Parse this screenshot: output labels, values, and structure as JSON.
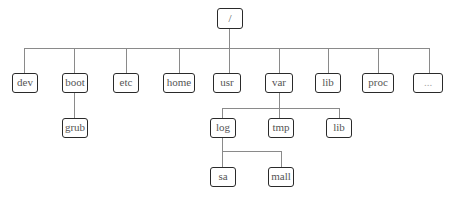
{
  "diagram": {
    "type": "directory-tree",
    "root": {
      "label": "/"
    },
    "level1": [
      {
        "label": "dev"
      },
      {
        "label": "boot"
      },
      {
        "label": "etc"
      },
      {
        "label": "home"
      },
      {
        "label": "usr"
      },
      {
        "label": "var"
      },
      {
        "label": "lib"
      },
      {
        "label": "proc"
      },
      {
        "label": "..."
      }
    ],
    "boot_children": [
      {
        "label": "grub"
      }
    ],
    "var_children": [
      {
        "label": "log"
      },
      {
        "label": "tmp"
      },
      {
        "label": "lib"
      }
    ],
    "log_children": [
      {
        "label": "sa"
      },
      {
        "label": "mall"
      }
    ],
    "colors": {
      "border": "#2a2a2a",
      "connector": "#8a8a8a",
      "text": "#555555",
      "background": "#ffffff"
    }
  }
}
